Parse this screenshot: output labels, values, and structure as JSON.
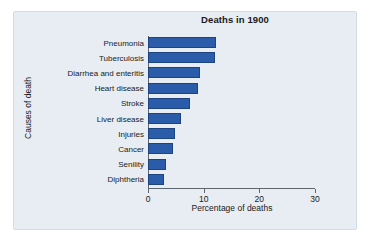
{
  "figure": {
    "panel_background": "#e7edf3",
    "panel_border": "#d3dbe3",
    "page_background": "#ffffff"
  },
  "chart_data": {
    "type": "bar",
    "orientation": "horizontal",
    "title": "Deaths in 1900",
    "xlabel": "Percentage of deaths",
    "ylabel": "Causes of death",
    "categories": [
      "Pneumonia",
      "Tuberculosis",
      "Diarrhea and enteritis",
      "Heart disease",
      "Stroke",
      "Liver disease",
      "Injuries",
      "Cancer",
      "Senility",
      "Diphtheria"
    ],
    "values": [
      12.2,
      12.0,
      9.3,
      9.0,
      7.5,
      6.0,
      4.8,
      4.5,
      3.3,
      2.9
    ],
    "xlim": [
      0,
      30
    ],
    "xticks": [
      0,
      10,
      20,
      30
    ],
    "xtick_labels": [
      "0",
      "10",
      "20",
      "30"
    ],
    "grid": false,
    "legend": null,
    "bar_color": "#2a5caa",
    "bar_edge_color": "#1d4480",
    "axis_color": "#5b6670"
  }
}
